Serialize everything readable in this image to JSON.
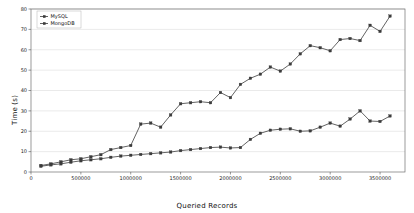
{
  "chart_data": {
    "type": "line",
    "title": "",
    "xlabel": "Queried Records",
    "ylabel": "Time (s)",
    "xlim": [
      0,
      3750000
    ],
    "ylim": [
      0,
      80
    ],
    "grid": true,
    "grid_axis": "y",
    "legend_position": "upper left",
    "xticks": [
      0,
      500000,
      1000000,
      1500000,
      2000000,
      2500000,
      3000000,
      3500000
    ],
    "xtick_labels": [
      "0",
      "500000",
      "1000000",
      "1500000",
      "2000000",
      "2500000",
      "3000000",
      "3500000"
    ],
    "yticks": [
      0,
      10,
      20,
      30,
      40,
      50,
      60,
      70,
      80
    ],
    "ytick_labels": [
      "0",
      "10",
      "20",
      "30",
      "40",
      "50",
      "60",
      "70",
      "80"
    ],
    "marker": "square",
    "series": [
      {
        "name": "MySQL",
        "color": "#3b3b3b",
        "x": [
          100000,
          200000,
          300000,
          400000,
          500000,
          600000,
          700000,
          800000,
          900000,
          1000000,
          1100000,
          1200000,
          1300000,
          1400000,
          1500000,
          1600000,
          1700000,
          1800000,
          1900000,
          2000000,
          2100000,
          2200000,
          2300000,
          2400000,
          2500000,
          2600000,
          2700000,
          2800000,
          2900000,
          3000000,
          3100000,
          3200000,
          3300000,
          3400000,
          3500000,
          3600000
        ],
        "values": [
          3.2,
          4.0,
          5.0,
          6.0,
          6.5,
          7.5,
          8.5,
          11.0,
          12.0,
          13.0,
          23.5,
          24.0,
          22.0,
          28.0,
          33.5,
          34.0,
          34.5,
          34.0,
          39.0,
          36.5,
          43.0,
          46.0,
          48.0,
          51.5,
          49.5,
          53.0,
          58.0,
          62.0,
          61.0,
          59.5,
          65.0,
          65.5,
          64.5,
          72.0,
          69.0,
          76.5
        ]
      },
      {
        "name": "MongoDB",
        "color": "#3b3b3b",
        "x": [
          100000,
          200000,
          300000,
          400000,
          500000,
          600000,
          700000,
          800000,
          900000,
          1000000,
          1100000,
          1200000,
          1300000,
          1400000,
          1500000,
          1600000,
          1700000,
          1800000,
          1900000,
          2000000,
          2100000,
          2200000,
          2300000,
          2400000,
          2500000,
          2600000,
          2700000,
          2800000,
          2900000,
          3000000,
          3100000,
          3200000,
          3300000,
          3400000,
          3500000,
          3600000
        ],
        "values": [
          2.8,
          3.5,
          4.0,
          4.8,
          5.5,
          6.0,
          6.5,
          7.2,
          7.8,
          8.2,
          8.6,
          9.0,
          9.4,
          9.8,
          10.5,
          11.0,
          11.5,
          12.0,
          12.2,
          11.8,
          12.0,
          16.0,
          19.0,
          20.5,
          21.0,
          21.2,
          20.0,
          20.2,
          22.0,
          24.0,
          22.5,
          26.0,
          30.0,
          25.0,
          24.8,
          27.5
        ]
      }
    ]
  },
  "legend": {
    "items": [
      {
        "label": "MySQL"
      },
      {
        "label": "MongoDB"
      }
    ]
  }
}
